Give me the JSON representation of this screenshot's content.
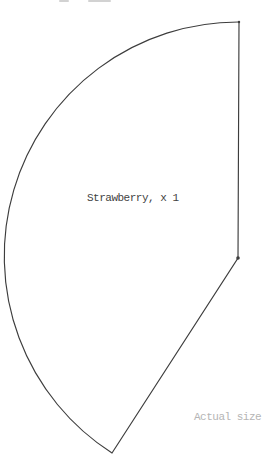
{
  "page": {
    "background": "#ffffff",
    "line_color": "#3d3d3d",
    "label_color": "#424242",
    "muted_color": "#b5b5b5"
  },
  "pattern": {
    "label": "Strawberry, x 1",
    "note": "Actual size",
    "shape": {
      "type": "circle-sector",
      "top_right": [
        239,
        22
      ],
      "corner": [
        238,
        258
      ],
      "bottom_point": [
        112,
        453
      ],
      "arc_radius": 234,
      "corner_dot_radius": 1.8,
      "top_dot_radius": 1.2,
      "stroke_width": 1.15
    }
  },
  "artifacts": {
    "description": "cropped text remnants at top edge"
  }
}
